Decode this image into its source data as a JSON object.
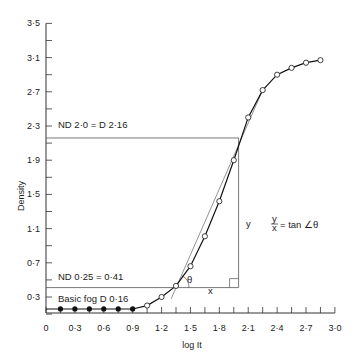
{
  "chart_data": {
    "type": "line",
    "title": "",
    "xlabel": "log It",
    "ylabel": "Density",
    "xlim": [
      0,
      3.0
    ],
    "ylim": [
      0,
      3.5
    ],
    "grid": false,
    "x_ticks": [
      "0",
      "0·3",
      "0·6",
      "0·9",
      "1·2",
      "1·5",
      "1·8",
      "2·1",
      "2·4",
      "2·7",
      "3·0"
    ],
    "x_tick_values": [
      0,
      0.3,
      0.6,
      0.9,
      1.2,
      1.5,
      1.8,
      2.1,
      2.4,
      2.7,
      3.0
    ],
    "y_ticks": [
      "0·3",
      "0·7",
      "1·1",
      "1·5",
      "1·9",
      "2·3",
      "2·7",
      "3·1",
      "3·5"
    ],
    "y_tick_values": [
      0.3,
      0.7,
      1.1,
      1.5,
      1.9,
      2.3,
      2.7,
      3.1,
      3.5
    ],
    "series": [
      {
        "name": "Basic fog (filled points)",
        "marker": "filled-circle",
        "x": [
          0.15,
          0.3,
          0.45,
          0.6,
          0.75,
          0.9
        ],
        "y": [
          0.16,
          0.16,
          0.16,
          0.16,
          0.16,
          0.16
        ]
      },
      {
        "name": "Characteristic curve (open points)",
        "marker": "open-circle",
        "x": [
          1.05,
          1.2,
          1.35,
          1.5,
          1.65,
          1.8,
          1.95,
          2.1,
          2.25,
          2.4,
          2.55,
          2.7,
          2.85
        ],
        "y": [
          0.2,
          0.3,
          0.43,
          0.66,
          1.01,
          1.42,
          1.9,
          2.4,
          2.72,
          2.9,
          2.98,
          3.04,
          3.07
        ]
      }
    ],
    "tangent_line": {
      "x": [
        1.3,
        2.25
      ],
      "y": [
        0.28,
        2.72
      ]
    },
    "reference_lines": [
      {
        "label": "ND 2·0 = D 2·16",
        "y": 2.16,
        "x_end": 2.0
      },
      {
        "label": "ND 0·25 = 0·41",
        "y": 0.41,
        "x_end": 2.0
      }
    ],
    "annotations": [
      {
        "text": "Basic fog D 0·16",
        "x": 0.15,
        "y": 0.3
      },
      {
        "text": "θ",
        "x": 1.45,
        "y": 0.5
      },
      {
        "text": "x",
        "x": 1.7,
        "y": 0.32
      },
      {
        "text": "y",
        "x": 2.06,
        "y": 1.2
      },
      {
        "text": "y/x = tan ∠θ",
        "x": 2.3,
        "y": 1.2
      }
    ]
  },
  "labels": {
    "ylabel": "Density",
    "xlabel": "log It",
    "nd20": "ND 2·0 = D 2·16",
    "nd025": "ND 0·25 = 0·41",
    "fog": "Basic fog D 0·16",
    "theta": "θ",
    "x_leg": "x",
    "y_leg": "y",
    "frac_num": "y",
    "frac_den": "x",
    "tan_text": "= tan ∠θ"
  }
}
